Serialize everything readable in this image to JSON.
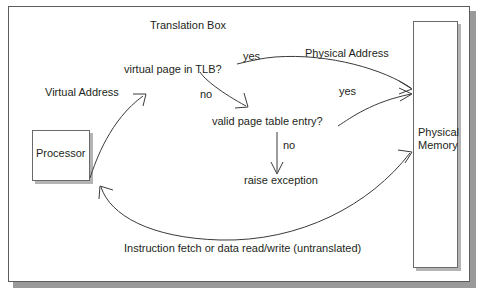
{
  "diagram": {
    "title": "Translation Box",
    "type": "flow-diagram",
    "nodes": {
      "processor": "Processor",
      "physical_memory": "Physical\nMemory",
      "physical_memory_line1": "Physical",
      "physical_memory_line2": "Memory",
      "tlb_decision": "virtual page in TLB?",
      "pte_decision": "valid page table entry?",
      "raise_exception": "raise exception"
    },
    "edge_labels": {
      "virtual_address": "Virtual Address",
      "tlb_yes": "yes",
      "physical_address": "Physical Address",
      "tlb_no": "no",
      "pte_yes": "yes",
      "pte_no": "no",
      "untranslated": "Instruction fetch or data read/write (untranslated)"
    },
    "colors": {
      "text": "#231f20",
      "stroke": "#3a3a3a",
      "box_border": "#6a6a6a",
      "frame_border": "#5d5d5d",
      "shadow": "#b4b4b4",
      "background": "#ffffff"
    }
  }
}
